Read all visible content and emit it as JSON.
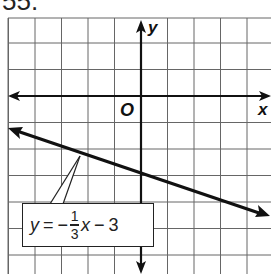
{
  "problem_number": "55.",
  "chart_data": {
    "type": "line",
    "title": "",
    "xlabel": "x",
    "ylabel": "y",
    "origin_label": "O",
    "grid": true,
    "xlim": [
      -5,
      5
    ],
    "ylim": [
      -6.5,
      3
    ],
    "series": [
      {
        "name": "y = -1/3 x - 3",
        "slope": -0.3333,
        "intercept": -3,
        "x": [
          -5,
          -3,
          0,
          3,
          5
        ],
        "y": [
          -1.33,
          -2,
          -3,
          -4,
          -4.67
        ]
      }
    ],
    "annotation": {
      "text": "y = −1/3 x − 3",
      "parts": {
        "lhs": "y",
        "eq": "=",
        "neg": "−",
        "num": "1",
        "den": "3",
        "var": "x",
        "op": "−",
        "const": "3"
      }
    }
  },
  "colors": {
    "grid": "#555555",
    "axis": "#111111",
    "line": "#111111",
    "background": "#ffffff"
  }
}
